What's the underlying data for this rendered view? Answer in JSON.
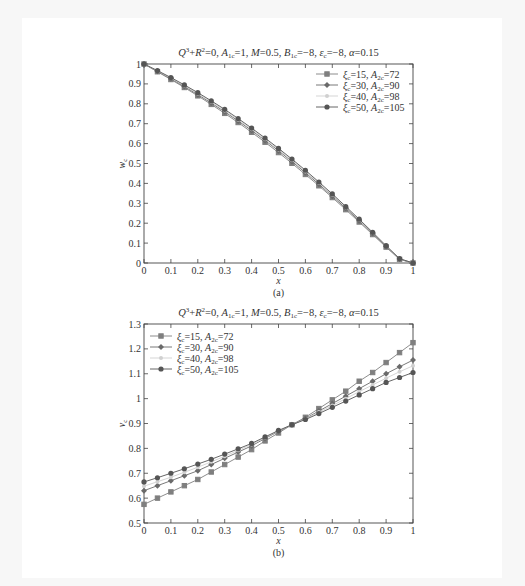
{
  "chart_data": [
    {
      "id": "a",
      "type": "line",
      "title": "Q³+R²=0, A₁c=1, M=0.5, B₁c=−8, εc=−8, α=0.15",
      "xlabel": "x",
      "ylabel": "w_c",
      "caption": "(a)",
      "xlim": [
        0,
        1
      ],
      "ylim": [
        0,
        1
      ],
      "xticks": [
        "0",
        "0.1",
        "0.2",
        "0.3",
        "0.4",
        "0.5",
        "0.6",
        "0.7",
        "0.8",
        "0.9",
        "1"
      ],
      "yticks": [
        "0",
        "0.1",
        "0.2",
        "0.3",
        "0.4",
        "0.5",
        "0.6",
        "0.7",
        "0.8",
        "0.9",
        "1"
      ],
      "legend_position": "upper right",
      "x": [
        0,
        0.05,
        0.1,
        0.15,
        0.2,
        0.25,
        0.3,
        0.35,
        0.4,
        0.45,
        0.5,
        0.55,
        0.6,
        0.65,
        0.7,
        0.75,
        0.8,
        0.85,
        0.9,
        0.95,
        1
      ],
      "series": [
        {
          "name": "ξc=15, A2c=72",
          "values": [
            1,
            0.961,
            0.922,
            0.882,
            0.84,
            0.797,
            0.752,
            0.706,
            0.657,
            0.607,
            0.555,
            0.501,
            0.445,
            0.388,
            0.329,
            0.268,
            0.206,
            0.143,
            0.08,
            0.018,
            0
          ]
        },
        {
          "name": "ξc=30, A2c=90",
          "values": [
            1,
            0.963,
            0.926,
            0.887,
            0.846,
            0.804,
            0.76,
            0.714,
            0.666,
            0.616,
            0.564,
            0.51,
            0.454,
            0.396,
            0.336,
            0.275,
            0.212,
            0.148,
            0.083,
            0.02,
            0
          ]
        },
        {
          "name": "ξc=40, A2c=98",
          "values": [
            1,
            0.965,
            0.929,
            0.891,
            0.851,
            0.81,
            0.766,
            0.72,
            0.672,
            0.622,
            0.57,
            0.516,
            0.46,
            0.402,
            0.342,
            0.28,
            0.216,
            0.151,
            0.085,
            0.021,
            0
          ]
        },
        {
          "name": "ξc=50, A2c=105",
          "values": [
            1,
            0.967,
            0.932,
            0.895,
            0.856,
            0.815,
            0.772,
            0.726,
            0.678,
            0.628,
            0.576,
            0.522,
            0.466,
            0.407,
            0.347,
            0.284,
            0.22,
            0.154,
            0.087,
            0.022,
            0
          ]
        }
      ]
    },
    {
      "id": "b",
      "type": "line",
      "title": "Q³+R²=0, A₁c=1, M=0.5, B₁c=−8, εc=−8, α=0.15",
      "xlabel": "x",
      "ylabel": "v_c",
      "caption": "(b)",
      "xlim": [
        0,
        1
      ],
      "ylim": [
        0.5,
        1.3
      ],
      "xticks": [
        "0",
        "0.1",
        "0.2",
        "0.3",
        "0.4",
        "0.5",
        "0.6",
        "0.7",
        "0.8",
        "0.9",
        "1"
      ],
      "yticks": [
        "0.5",
        "0.6",
        "0.7",
        "0.8",
        "0.9",
        "1",
        "1.1",
        "1.2",
        "1.3"
      ],
      "legend_position": "upper left",
      "x": [
        0,
        0.05,
        0.1,
        0.15,
        0.2,
        0.25,
        0.3,
        0.35,
        0.4,
        0.45,
        0.5,
        0.55,
        0.6,
        0.65,
        0.7,
        0.75,
        0.8,
        0.85,
        0.9,
        0.95,
        1
      ],
      "series": [
        {
          "name": "ξc=15, A2c=72",
          "values": [
            0.575,
            0.6,
            0.625,
            0.65,
            0.675,
            0.705,
            0.735,
            0.765,
            0.795,
            0.83,
            0.862,
            0.895,
            0.925,
            0.96,
            0.995,
            1.03,
            1.07,
            1.105,
            1.145,
            1.185,
            1.225
          ]
        },
        {
          "name": "ξc=30, A2c=90",
          "values": [
            0.63,
            0.65,
            0.67,
            0.69,
            0.71,
            0.735,
            0.76,
            0.785,
            0.81,
            0.84,
            0.868,
            0.895,
            0.92,
            0.95,
            0.98,
            1.01,
            1.04,
            1.07,
            1.1,
            1.128,
            1.155
          ]
        },
        {
          "name": "ξc=40, A2c=98",
          "values": [
            0.648,
            0.666,
            0.684,
            0.704,
            0.724,
            0.746,
            0.768,
            0.792,
            0.816,
            0.843,
            0.87,
            0.895,
            0.918,
            0.946,
            0.972,
            1.0,
            1.028,
            1.055,
            1.082,
            1.108,
            1.132
          ]
        },
        {
          "name": "ξc=50, A2c=105",
          "values": [
            0.665,
            0.682,
            0.7,
            0.718,
            0.737,
            0.756,
            0.777,
            0.798,
            0.82,
            0.846,
            0.872,
            0.895,
            0.916,
            0.94,
            0.965,
            0.99,
            1.015,
            1.04,
            1.065,
            1.085,
            1.105
          ]
        }
      ]
    }
  ],
  "styles": {
    "series_colors": [
      "#7f7f7f",
      "#6a6a6a",
      "#d0d0d0",
      "#555555"
    ],
    "axis_color": "#444444"
  }
}
